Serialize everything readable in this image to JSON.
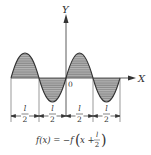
{
  "figure": {
    "axis_labels": {
      "y": "Y",
      "x": "X",
      "origin": "0"
    },
    "segment_labels": [
      {
        "num": "l",
        "den": "2"
      },
      {
        "num": "l",
        "den": "2"
      },
      {
        "num": "l",
        "den": "2"
      },
      {
        "num": "l",
        "den": "2"
      }
    ],
    "formula": {
      "lhs": "f(x) = −f",
      "arg_x": "x +",
      "frac_num": "l",
      "frac_den": "2"
    },
    "colors": {
      "stroke": "#333333",
      "fill": "#8a8a8a",
      "hatch": "#d9d9d9"
    }
  }
}
